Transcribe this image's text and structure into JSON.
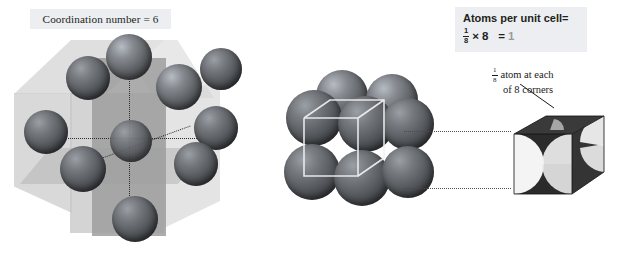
{
  "figure": {
    "type": "diagram"
  },
  "left_panel": {
    "label": "Coordination number = 6",
    "coordination_number": 6,
    "description": "Central atom surrounded by six nearest neighbors within a translucent cube with cross-section planes",
    "sphere_count": 7,
    "axis_count": 3
  },
  "middle_panel": {
    "description": "Eight touching spheres at the corners of a simple cubic unit cell with white wireframe cube outline",
    "sphere_count": 8
  },
  "right_panel": {
    "header_title": "Atoms per unit cell=",
    "equation": {
      "fraction_numerator": "1",
      "fraction_denominator": "8",
      "times_symbol": "×",
      "multiplier": "8",
      "equals_symbol": "=",
      "result": "1"
    },
    "callout": {
      "fraction_numerator": "1",
      "fraction_denominator": "8",
      "line1_text": "atom at each",
      "line2_text": "of 8 corners"
    },
    "cube_description": "Dark cube with eighth-sphere cutouts carved at each visible corner"
  },
  "colors": {
    "background": "#ffffff",
    "label_box_background": "#eceef1",
    "text": "#231f20",
    "result_text": "#9b9b9b",
    "sphere_dark": "#3b3e42",
    "sphere_light": "#9aa0a6",
    "cube_translucent": "#cfcfcf",
    "cube_plane": "#9e9e9e",
    "small_cube": "#2f2f2f",
    "dotted_line": "#4a4a4a",
    "wireframe": "#f2f2f2"
  }
}
